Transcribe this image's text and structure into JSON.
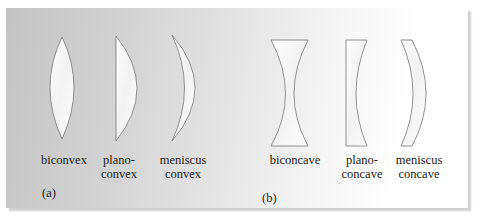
{
  "figure": {
    "panels": [
      {
        "tag": "(a)",
        "lenses": [
          {
            "type": "biconvex",
            "label": "biconvex"
          },
          {
            "type": "plano-convex",
            "label": "plano-\nconvex"
          },
          {
            "type": "meniscus-convex",
            "label": "meniscus\nconvex"
          }
        ]
      },
      {
        "tag": "(b)",
        "lenses": [
          {
            "type": "biconcave",
            "label": "biconcave"
          },
          {
            "type": "plano-concave",
            "label": "plano-\nconcave"
          },
          {
            "type": "meniscus-concave",
            "label": "meniscus\nconcave"
          }
        ]
      }
    ],
    "colors": {
      "lens_fill": "#ffffff",
      "lens_stroke": "#777777",
      "text": "#222222"
    }
  }
}
